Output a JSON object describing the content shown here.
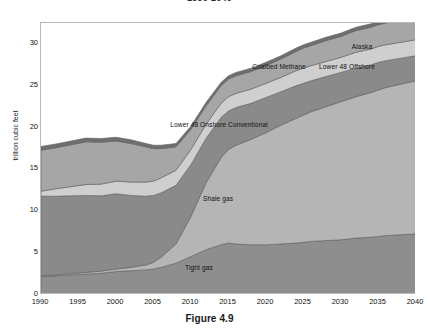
{
  "chart_data": {
    "type": "area",
    "stacked": true,
    "title": "1990-2040",
    "caption": "Figure 4.9",
    "xlabel": "",
    "ylabel": "trillion cubic feet",
    "grid": false,
    "legend_position": "inline-annotations",
    "xlim": [
      1990,
      2040
    ],
    "ylim": [
      0,
      32.5
    ],
    "yticks": [
      0,
      5,
      10,
      15,
      20,
      25,
      30
    ],
    "xticks": [
      1990,
      1995,
      2000,
      2005,
      2010,
      2015,
      2020,
      2025,
      2030,
      2035,
      2040
    ],
    "x": [
      1990,
      1992,
      1994,
      1996,
      1998,
      2000,
      2002,
      2004,
      2005,
      2006,
      2008,
      2010,
      2012,
      2014,
      2015,
      2016,
      2018,
      2020,
      2022,
      2024,
      2025,
      2026,
      2028,
      2030,
      2032,
      2034,
      2035,
      2036,
      2038,
      2040
    ],
    "series": [
      {
        "name": "Tight gas",
        "color": "#8e8e8e",
        "values": [
          2.2,
          2.3,
          2.4,
          2.5,
          2.6,
          2.8,
          2.9,
          3.0,
          3.1,
          3.3,
          3.8,
          4.6,
          5.4,
          6.0,
          6.2,
          6.1,
          6.0,
          6.0,
          6.1,
          6.2,
          6.3,
          6.4,
          6.5,
          6.6,
          6.8,
          6.9,
          7.0,
          7.1,
          7.2,
          7.3
        ]
      },
      {
        "name": "Shale gas",
        "color": "#b5b5b5",
        "values": [
          0.1,
          0.1,
          0.15,
          0.2,
          0.25,
          0.3,
          0.4,
          0.6,
          0.8,
          1.2,
          2.3,
          4.8,
          8.0,
          10.4,
          11.2,
          11.8,
          12.6,
          13.4,
          14.2,
          14.9,
          15.2,
          15.5,
          16.0,
          16.5,
          16.9,
          17.3,
          17.5,
          17.7,
          18.0,
          18.3
        ]
      },
      {
        "name": "Lower 48 Onshore Conventional",
        "color": "#8a8a8a",
        "values": [
          9.5,
          9.4,
          9.3,
          9.2,
          9.0,
          9.0,
          8.6,
          8.2,
          8.0,
          7.7,
          7.0,
          6.2,
          5.3,
          4.8,
          4.6,
          4.5,
          4.3,
          4.2,
          4.0,
          3.9,
          3.8,
          3.7,
          3.6,
          3.5,
          3.4,
          3.3,
          3.3,
          3.2,
          3.1,
          3.0
        ]
      },
      {
        "name": "Coalbed Methane",
        "color": "#cfcfcf",
        "values": [
          0.6,
          0.9,
          1.1,
          1.3,
          1.4,
          1.5,
          1.6,
          1.7,
          1.7,
          1.8,
          1.8,
          1.8,
          1.7,
          1.7,
          1.7,
          1.7,
          1.7,
          1.7,
          1.7,
          1.8,
          1.8,
          1.8,
          1.8,
          1.8,
          1.9,
          1.9,
          1.9,
          1.9,
          1.9,
          1.9
        ]
      },
      {
        "name": "Lower 48 Offshore",
        "color": "#a6a6a6",
        "values": [
          4.9,
          4.9,
          5.0,
          5.1,
          5.0,
          4.8,
          4.6,
          4.2,
          3.9,
          3.5,
          2.8,
          2.4,
          2.2,
          2.1,
          2.1,
          2.1,
          2.1,
          2.1,
          2.2,
          2.3,
          2.4,
          2.4,
          2.5,
          2.5,
          2.6,
          2.6,
          2.6,
          2.6,
          2.7,
          2.7
        ]
      },
      {
        "name": "Alaska",
        "color": "#6f6f6f",
        "values": [
          0.45,
          0.45,
          0.45,
          0.45,
          0.45,
          0.45,
          0.45,
          0.4,
          0.4,
          0.4,
          0.4,
          0.4,
          0.4,
          0.4,
          0.4,
          0.4,
          0.4,
          0.4,
          0.4,
          0.4,
          0.4,
          0.4,
          0.4,
          0.4,
          0.4,
          0.4,
          0.4,
          0.4,
          0.4,
          0.4
        ]
      }
    ],
    "annotations": [
      {
        "text": "Alaska",
        "x": 362,
        "y": 44
      },
      {
        "text": "Coalbed Methane",
        "x": 279,
        "y": 64
      },
      {
        "text": "Lower 48 Offshore",
        "x": 347,
        "y": 64
      },
      {
        "text": "Lower 48 Onshore Conventional",
        "x": 219,
        "y": 122
      },
      {
        "text": "Shale gas",
        "x": 218,
        "y": 196
      },
      {
        "text": "Tight gas",
        "x": 199,
        "y": 265
      }
    ]
  }
}
